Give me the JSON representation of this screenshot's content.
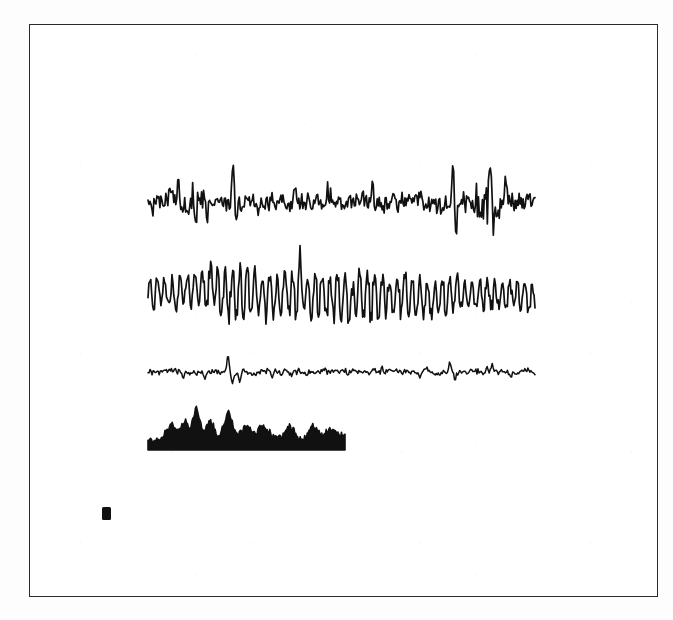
{
  "figure": {
    "type": "multi-trace-signal-recording",
    "background_color": "#ffffff",
    "ink_color": "#111111",
    "frame": {
      "name": "figure-border",
      "x": 29,
      "y": 24,
      "width": 629,
      "height": 573,
      "border_color": "#2b2b2b",
      "border_width": 1.4
    },
    "calibration_mark": {
      "label": "",
      "x": 102,
      "y": 507,
      "width": 9,
      "height": 13,
      "color": "#111111"
    }
  },
  "chart_data": {
    "type": "line",
    "title": "",
    "subtitle": "",
    "xlabel": "",
    "ylabel": "",
    "grid": false,
    "legend_position": "none",
    "annotations": [],
    "axis_ranges": {
      "x": [
        148,
        535
      ],
      "y": [
        150,
        470
      ]
    },
    "series": [
      {
        "name": "trace-1-spiky-eeg",
        "index": 1,
        "style": "line",
        "baseline_y": 203,
        "x_start": 148,
        "x_end": 535,
        "amplitude_typical": 10,
        "amplitude_max": 45,
        "sample_count": 390,
        "seed": 101,
        "description": "high-frequency low-amplitude background with several tall isolated spikes and burst clusters",
        "spikes": [
          {
            "x": 178,
            "height": 26,
            "direction": "up"
          },
          {
            "x": 193,
            "height": 19,
            "direction": "up"
          },
          {
            "x": 196,
            "height": 17,
            "direction": "down"
          },
          {
            "x": 207,
            "height": 17,
            "direction": "down"
          },
          {
            "x": 233,
            "height": 45,
            "direction": "up"
          },
          {
            "x": 236,
            "height": 24,
            "direction": "down"
          },
          {
            "x": 258,
            "height": 16,
            "direction": "down"
          },
          {
            "x": 295,
            "height": 15,
            "direction": "up"
          },
          {
            "x": 327,
            "height": 14,
            "direction": "up"
          },
          {
            "x": 372,
            "height": 16,
            "direction": "up"
          },
          {
            "x": 404,
            "height": 15,
            "direction": "down"
          },
          {
            "x": 420,
            "height": 14,
            "direction": "up"
          },
          {
            "x": 453,
            "height": 44,
            "direction": "up"
          },
          {
            "x": 456,
            "height": 40,
            "direction": "down"
          },
          {
            "x": 490,
            "height": 42,
            "direction": "up"
          },
          {
            "x": 493,
            "height": 26,
            "direction": "down"
          },
          {
            "x": 506,
            "height": 20,
            "direction": "up"
          }
        ],
        "bursts": [
          {
            "x_center": 198,
            "width": 16,
            "gain": 2.0
          },
          {
            "x_center": 489,
            "width": 26,
            "gain": 2.3
          }
        ]
      },
      {
        "name": "trace-2-oscillatory-rhythm",
        "index": 2,
        "style": "line",
        "baseline_y": 295,
        "x_start": 148,
        "x_end": 535,
        "amplitude_typical": 17,
        "amplitude_max": 30,
        "sample_count": 420,
        "seed": 202,
        "description": "continuous dense sinusoidal alpha-like rhythm, amplitude largest in the middle third",
        "oscillation_period_px": 7.5,
        "envelope": [
          {
            "x": 148,
            "gain": 0.85
          },
          {
            "x": 200,
            "gain": 1.05
          },
          {
            "x": 230,
            "gain": 1.35
          },
          {
            "x": 300,
            "gain": 1.15
          },
          {
            "x": 350,
            "gain": 1.4
          },
          {
            "x": 400,
            "gain": 1.1
          },
          {
            "x": 470,
            "gain": 0.9
          },
          {
            "x": 535,
            "gain": 0.8
          }
        ],
        "spikes": [
          {
            "x": 212,
            "height": 30,
            "direction": "up"
          },
          {
            "x": 300,
            "height": 27,
            "direction": "up"
          },
          {
            "x": 352,
            "height": 26,
            "direction": "down"
          }
        ]
      },
      {
        "name": "trace-3-flat-low-amplitude",
        "index": 3,
        "style": "line",
        "baseline_y": 372,
        "x_start": 148,
        "x_end": 535,
        "amplitude_typical": 3,
        "amplitude_max": 18,
        "sample_count": 380,
        "seed": 303,
        "description": "near-flat baseline with sparse small biphasic deflections and one prominent spike",
        "spikes": [
          {
            "x": 183,
            "height": 7,
            "direction": "down"
          },
          {
            "x": 205,
            "height": 8,
            "direction": "down"
          },
          {
            "x": 228,
            "height": 18,
            "direction": "up"
          },
          {
            "x": 232,
            "height": 13,
            "direction": "down"
          },
          {
            "x": 240,
            "height": 9,
            "direction": "down"
          },
          {
            "x": 272,
            "height": 6,
            "direction": "down"
          },
          {
            "x": 292,
            "height": 6,
            "direction": "down"
          },
          {
            "x": 348,
            "height": 5,
            "direction": "down"
          },
          {
            "x": 382,
            "height": 7,
            "direction": "up"
          },
          {
            "x": 420,
            "height": 6,
            "direction": "down"
          },
          {
            "x": 450,
            "height": 12,
            "direction": "up"
          },
          {
            "x": 455,
            "height": 8,
            "direction": "down"
          },
          {
            "x": 487,
            "height": 10,
            "direction": "up"
          },
          {
            "x": 492,
            "height": 9,
            "direction": "up"
          },
          {
            "x": 510,
            "height": 5,
            "direction": "down"
          }
        ]
      },
      {
        "name": "trace-4-rectified-envelope",
        "index": 4,
        "style": "filled-area",
        "baseline_y": 450,
        "x_start": 148,
        "x_end": 345,
        "amplitude_typical": 9,
        "amplitude_max": 30,
        "sample_count": 220,
        "seed": 404,
        "description": "solid filled rectified activity envelope, shorter duration than the other traces, two dominant peaks",
        "peaks": [
          {
            "x": 197,
            "height": 30
          },
          {
            "x": 228,
            "height": 27
          },
          {
            "x": 172,
            "height": 15
          },
          {
            "x": 186,
            "height": 17
          },
          {
            "x": 210,
            "height": 16
          },
          {
            "x": 248,
            "height": 14
          },
          {
            "x": 262,
            "height": 12
          },
          {
            "x": 290,
            "height": 10
          },
          {
            "x": 312,
            "height": 13
          },
          {
            "x": 330,
            "height": 8
          }
        ]
      }
    ]
  }
}
